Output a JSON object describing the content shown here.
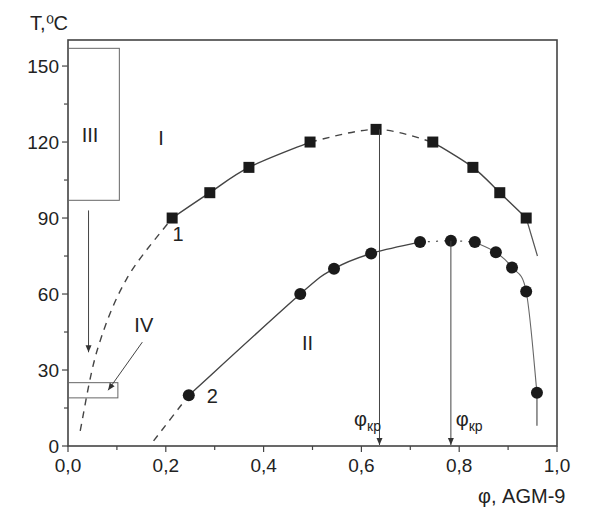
{
  "chart_data": {
    "type": "scatter",
    "title": "",
    "xlabel": "φ, AGM-9",
    "ylabel": "T,⁰C",
    "xlim": [
      0.0,
      1.0
    ],
    "ylim": [
      0,
      160
    ],
    "grid": false,
    "x_ticks": [
      "0,0",
      "0,2",
      "0,4",
      "0,6",
      "0,8",
      "1,0"
    ],
    "x_tick_values": [
      0.0,
      0.2,
      0.4,
      0.6,
      0.8,
      1.0
    ],
    "y_ticks": [
      "0",
      "30",
      "60",
      "90",
      "120",
      "150"
    ],
    "y_tick_values": [
      0,
      30,
      60,
      90,
      120,
      150
    ],
    "series": [
      {
        "name": "1",
        "marker": "square",
        "x": [
          0.213,
          0.29,
          0.37,
          0.495,
          0.63,
          0.746,
          0.828,
          0.883,
          0.937
        ],
        "y": [
          90,
          100,
          110,
          120,
          125,
          120,
          110,
          100,
          90
        ],
        "dashed_extension_left": [
          [
            0.025,
            6
          ],
          [
            0.06,
            38
          ],
          [
            0.12,
            66
          ],
          [
            0.213,
            90
          ]
        ],
        "dashed_segment": [
          [
            0.495,
            120
          ],
          [
            0.63,
            125
          ],
          [
            0.746,
            120
          ]
        ],
        "solid_extension_right": [
          [
            0.937,
            90
          ],
          [
            0.96,
            75
          ]
        ]
      },
      {
        "name": "2",
        "marker": "circle",
        "x": [
          0.247,
          0.475,
          0.544,
          0.62,
          0.72,
          0.783,
          0.832,
          0.875,
          0.908,
          0.937,
          0.959
        ],
        "y": [
          20,
          60,
          70,
          76,
          80.5,
          81,
          80.5,
          76.5,
          70.5,
          61,
          21
        ],
        "dashed_extension_left": [
          [
            0.175,
            2
          ],
          [
            0.247,
            20
          ]
        ],
        "dotted_segment": [
          [
            0.72,
            80.5
          ],
          [
            0.783,
            81
          ],
          [
            0.832,
            80.5
          ]
        ],
        "solid_extension_right": [
          [
            0.959,
            21
          ],
          [
            0.959,
            8
          ]
        ]
      }
    ],
    "annotations": [
      {
        "text": "I",
        "x": 0.19,
        "y": 119
      },
      {
        "text": "II",
        "x": 0.49,
        "y": 38
      },
      {
        "text": "III",
        "x": 0.045,
        "y": 120
      },
      {
        "text": "IV",
        "x": 0.155,
        "y": 45
      },
      {
        "text": "1",
        "x": 0.225,
        "y": 81
      },
      {
        "text": "2",
        "x": 0.295,
        "y": 17
      },
      {
        "text": "φ",
        "sub": "кр",
        "x": 0.585,
        "y": 8,
        "arrow_x": 0.637,
        "arrow_from_y": 125
      },
      {
        "text": "φ",
        "sub": "кр",
        "x": 0.793,
        "y": 8,
        "arrow_x": 0.783,
        "arrow_from_y": 81
      }
    ],
    "regions": [
      {
        "name": "III",
        "x0": 0.0,
        "x1": 0.105,
        "y0": 97,
        "y1": 157
      },
      {
        "name": "IV",
        "x0": 0.0,
        "x1": 0.102,
        "y0": 19,
        "y1": 25
      }
    ],
    "arrows": [
      {
        "from": [
          0.042,
          93
        ],
        "to": [
          0.042,
          37
        ]
      },
      {
        "from": [
          0.152,
          41
        ],
        "to": [
          0.082,
          22
        ]
      }
    ]
  }
}
